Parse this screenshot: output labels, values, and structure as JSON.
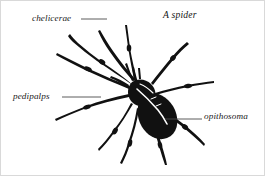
{
  "figure": {
    "title": "A spider",
    "background_color": "#ffffff",
    "ink_color": "#111111",
    "border_color": "#d9d9d9",
    "leader_line_color": "#4a4a4a",
    "width": 265,
    "height": 176
  },
  "labels": [
    {
      "id": "chelicerae",
      "text": "chelicerae",
      "position": "top-left",
      "leader_line": {
        "x1": 80,
        "y1": 18,
        "x2": 106,
        "y2": 18
      }
    },
    {
      "id": "pedipalps",
      "text": "pedipalps",
      "position": "middle-left",
      "leader_line": {
        "x1": 61,
        "y1": 96,
        "x2": 100,
        "y2": 96
      }
    },
    {
      "id": "opithosoma",
      "text": "opithosoma",
      "position": "middle-right",
      "leader_line": {
        "x1": 164,
        "y1": 118,
        "x2": 201,
        "y2": 118
      }
    }
  ]
}
